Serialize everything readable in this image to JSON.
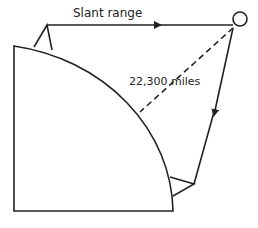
{
  "labels": {
    "slant_range": "Slant range",
    "distance": "22,300  miles"
  },
  "elements": {
    "earth": "quarter-circle earth segment",
    "satellite": "circle",
    "ground_station_top": "triangle antenna",
    "ground_station_bottom": "triangle antenna"
  },
  "colors": {
    "stroke": "#222222",
    "background": "#ffffff"
  }
}
